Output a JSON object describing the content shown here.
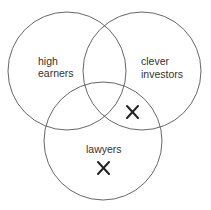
{
  "diagram": {
    "type": "venn",
    "sets": [
      {
        "id": "high-earners",
        "label_lines": [
          "high",
          "earners"
        ]
      },
      {
        "id": "clever-investors",
        "label_lines": [
          "clever",
          "investors"
        ]
      },
      {
        "id": "lawyers",
        "label_lines": [
          "lawyers"
        ]
      }
    ],
    "marks": [
      {
        "symbol": "✕",
        "region": "clever investors ∩ lawyers (not high earners)"
      },
      {
        "symbol": "✕",
        "region": "lawyers only"
      }
    ],
    "colors": {
      "stroke": "#555555",
      "text": "#333333",
      "mark": "#222222"
    }
  }
}
